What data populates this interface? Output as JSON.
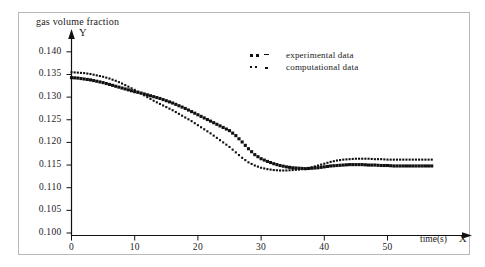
{
  "chart_data": {
    "type": "scatter",
    "title": "gas volume fraction",
    "xlabel": "time(s)",
    "ylabel": "",
    "x_axis_name": "X",
    "y_axis_name": "Y",
    "xlim": [
      0,
      57
    ],
    "ylim": [
      0.1,
      0.1425
    ],
    "grid": false,
    "legend_position": "top-right",
    "xticks": [
      0,
      10,
      20,
      30,
      40,
      50
    ],
    "xtick_labels": [
      "0",
      "10",
      "20",
      "30",
      "40",
      "50"
    ],
    "yticks": [
      0.1,
      0.105,
      0.11,
      0.115,
      0.12,
      0.125,
      0.13,
      0.135,
      0.14
    ],
    "ytick_labels": [
      "0.100",
      "0.105",
      "0.110",
      "0.115",
      "0.120",
      "0.125",
      "0.130",
      "0.135",
      "0.140"
    ],
    "series": [
      {
        "name": "experimental data",
        "marker": "square",
        "color": "#111111",
        "x": [
          0,
          1,
          2,
          3,
          4,
          5,
          6,
          7,
          8,
          9,
          10,
          11,
          12,
          13,
          14,
          15,
          16,
          17,
          18,
          19,
          20,
          21,
          22,
          23,
          24,
          25,
          26,
          27,
          28,
          29,
          30,
          31,
          32,
          33,
          34,
          35,
          36,
          37,
          38,
          39,
          40,
          41,
          42,
          43,
          44,
          45,
          46,
          47,
          48,
          49,
          50,
          51,
          52,
          53,
          54,
          55,
          56,
          57
        ],
        "values": [
          0.1343,
          0.1342,
          0.134,
          0.1338,
          0.1335,
          0.1332,
          0.1328,
          0.1324,
          0.132,
          0.1316,
          0.1312,
          0.1309,
          0.1305,
          0.1301,
          0.1297,
          0.1292,
          0.1287,
          0.1281,
          0.1275,
          0.1268,
          0.1261,
          0.1254,
          0.1247,
          0.124,
          0.1233,
          0.1226,
          0.1215,
          0.1201,
          0.1186,
          0.1173,
          0.1164,
          0.1158,
          0.1153,
          0.1149,
          0.1146,
          0.1144,
          0.1143,
          0.1142,
          0.1143,
          0.1144,
          0.1146,
          0.1148,
          0.1149,
          0.115,
          0.1151,
          0.1151,
          0.1151,
          0.115,
          0.115,
          0.1149,
          0.1149,
          0.1148,
          0.1148,
          0.1148,
          0.1148,
          0.1148,
          0.1148,
          0.1148
        ]
      },
      {
        "name": "computational data",
        "marker": "dot",
        "color": "#111111",
        "x": [
          0,
          1,
          2,
          3,
          4,
          5,
          6,
          7,
          8,
          9,
          10,
          11,
          12,
          13,
          14,
          15,
          16,
          17,
          18,
          19,
          20,
          21,
          22,
          23,
          24,
          25,
          26,
          27,
          28,
          29,
          30,
          31,
          32,
          33,
          34,
          35,
          36,
          37,
          38,
          39,
          40,
          41,
          42,
          43,
          44,
          45,
          46,
          47,
          48,
          49,
          50,
          51,
          52,
          53,
          54,
          55,
          56,
          57
        ],
        "values": [
          0.1355,
          0.1354,
          0.1353,
          0.1351,
          0.1348,
          0.1345,
          0.1341,
          0.1336,
          0.133,
          0.1323,
          0.1316,
          0.1308,
          0.13,
          0.1292,
          0.1285,
          0.1278,
          0.1271,
          0.1263,
          0.1255,
          0.1247,
          0.1238,
          0.1229,
          0.122,
          0.121,
          0.12,
          0.119,
          0.1178,
          0.1166,
          0.1156,
          0.1149,
          0.1144,
          0.1141,
          0.1139,
          0.1138,
          0.1138,
          0.1139,
          0.114,
          0.1142,
          0.1145,
          0.1149,
          0.1153,
          0.1157,
          0.116,
          0.1162,
          0.1163,
          0.1164,
          0.1164,
          0.1164,
          0.1163,
          0.1163,
          0.1162,
          0.1162,
          0.1162,
          0.1162,
          0.1162,
          0.1162,
          0.1162,
          0.1162
        ]
      }
    ]
  },
  "legend": {
    "items": [
      {
        "label": "experimental data"
      },
      {
        "label": "computational data"
      }
    ]
  }
}
